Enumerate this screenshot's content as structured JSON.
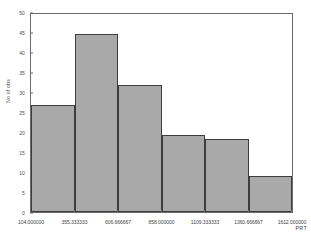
{
  "chart_data": {
    "type": "bar",
    "title": "",
    "xlabel": "",
    "ylabel": "No of obs",
    "ylim": [
      0,
      50
    ],
    "xlim": [
      104.0,
      1612.0
    ],
    "grid": false,
    "legend": null,
    "annotation": "PRT",
    "bin_edges": [
      104.0,
      355.333333,
      606.666667,
      858.0,
      1109.333333,
      1360.666667,
      1612.0
    ],
    "bin_edge_labels": [
      "104.000000",
      "355.333333",
      "606.666667",
      "858.000000",
      "1109.333333",
      "1360.666667",
      "1612.000000"
    ],
    "categories": [
      "104.000000-355.333333",
      "355.333333-606.666667",
      "606.666667-858.000000",
      "858.000000-1109.333333",
      "1109.333333-1360.666667",
      "1360.666667-1612.000000"
    ],
    "values": [
      27,
      45,
      32,
      19.5,
      18.5,
      9
    ],
    "ytick_values": [
      0,
      5,
      10,
      15,
      20,
      25,
      30,
      35,
      40,
      45,
      50
    ],
    "ytick_labels": [
      "0",
      "5",
      "10",
      "15",
      "20",
      "25",
      "30",
      "35",
      "40",
      "45",
      "50"
    ],
    "colors": {
      "bar_fill": "#a9a9a9",
      "bar_border": "#3d3d3d",
      "axis": "#6b6b6b",
      "text": "#3f3f3f",
      "background": "#ffffff"
    }
  }
}
